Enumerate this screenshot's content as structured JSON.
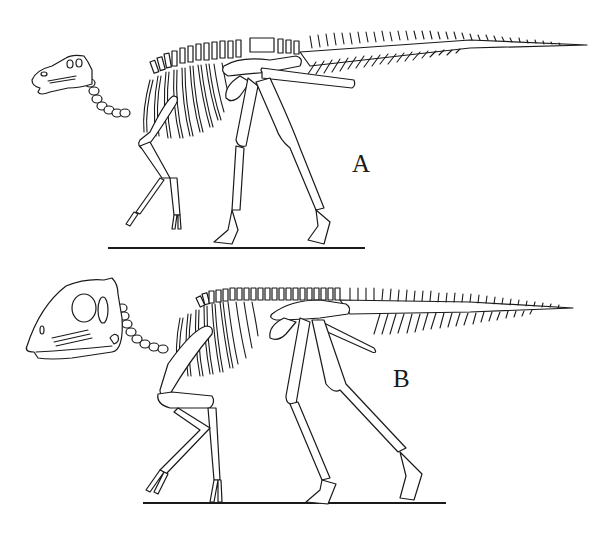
{
  "figure": {
    "background": "#ffffff",
    "ink_color": "#1a1a1a",
    "panels": [
      {
        "id": "A",
        "label": "A",
        "label_pos": {
          "x": 363,
          "y": 163
        },
        "ground_line": {
          "x1": 108,
          "x2": 365,
          "y": 248
        },
        "description": "Skeletal reconstruction, hadrosaurid in quadrupedal walking pose, low flat skull"
      },
      {
        "id": "B",
        "label": "B",
        "label_pos": {
          "x": 404,
          "y": 378
        },
        "ground_line": {
          "x1": 143,
          "x2": 446,
          "y": 503
        },
        "description": "Skeletal reconstruction, hadrosaurid with tall domed skull, quadrupedal walking pose"
      }
    ]
  }
}
